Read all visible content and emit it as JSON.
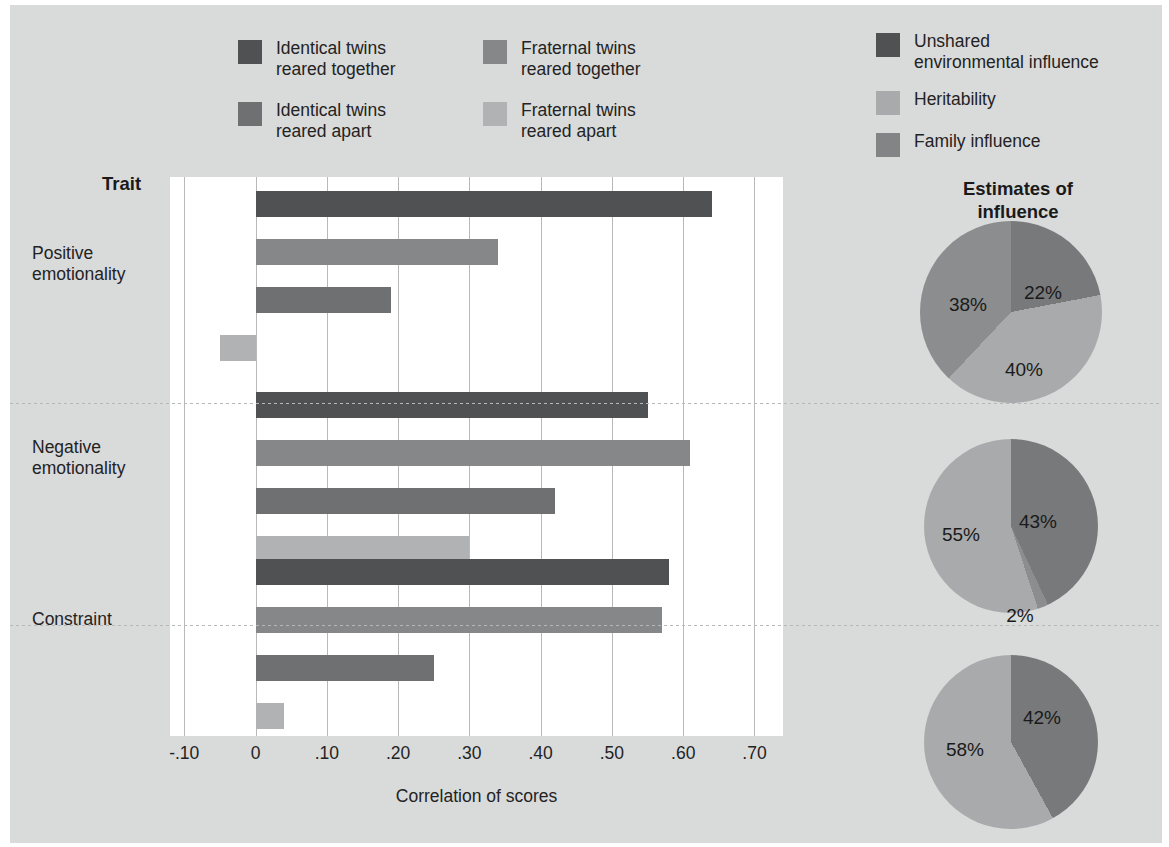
{
  "figure": {
    "background": "#d9dada",
    "plot_background": "#ffffff"
  },
  "bar_legend": {
    "items": [
      {
        "label": "Identical twins\nreared together",
        "color": "#4f5153"
      },
      {
        "label": "Fraternal twins\nreared together",
        "color": "#858789"
      },
      {
        "label": "Identical twins\nreared apart",
        "color": "#6e7072"
      },
      {
        "label": "Fraternal twins\nreared apart",
        "color": "#b0b2b3"
      }
    ]
  },
  "pie_legend": {
    "items": [
      {
        "label": "Unshared\nenvironmental influence",
        "color": "#4f5153"
      },
      {
        "label": "Heritability",
        "color": "#a8aaab"
      },
      {
        "label": "Family influence",
        "color": "#828486"
      }
    ]
  },
  "axis": {
    "trait_header": "Trait",
    "xlabel": "Correlation of scores",
    "xticks": [
      "-.10",
      "0",
      ".10",
      ".20",
      ".30",
      ".40",
      ".50",
      ".60",
      ".70"
    ],
    "xtick_values": [
      -0.1,
      0,
      0.1,
      0.2,
      0.3,
      0.4,
      0.5,
      0.6,
      0.7
    ]
  },
  "pies_title": "Estimates of\ninfluence",
  "chart_data": [
    {
      "type": "bar",
      "title": "",
      "xlabel": "Correlation of scores",
      "ylabel": "Trait",
      "xlim": [
        -0.12,
        0.74
      ],
      "grid": true,
      "orientation": "horizontal",
      "categories": [
        "Positive emotionality",
        "Negative emotionality",
        "Constraint"
      ],
      "series": [
        {
          "name": "Identical twins reared together",
          "color": "#4f5153",
          "values": [
            0.64,
            0.55,
            0.58
          ]
        },
        {
          "name": "Identical twins reared apart",
          "color": "#858789",
          "values": [
            0.34,
            0.61,
            0.57
          ]
        },
        {
          "name": "Fraternal twins reared together",
          "color": "#6e7072",
          "values": [
            0.19,
            0.42,
            0.25
          ]
        },
        {
          "name": "Fraternal twins reared apart",
          "color": "#b0b2b3",
          "values": [
            -0.05,
            0.3,
            0.04
          ]
        }
      ]
    },
    {
      "type": "pie",
      "title": "Estimates of influence",
      "name": "Positive emotionality",
      "labels": [
        "Unshared environmental influence",
        "Heritability",
        "Family influence"
      ],
      "values": [
        22,
        40,
        38
      ],
      "display": [
        "22%",
        "40%",
        "38%"
      ],
      "colors": [
        "#78797b",
        "#a8aaab",
        "#8b8d8e"
      ]
    },
    {
      "type": "pie",
      "name": "Negative emotionality",
      "labels": [
        "Unshared environmental influence",
        "Family influence",
        "Heritability"
      ],
      "values": [
        43,
        2,
        55
      ],
      "display": [
        "43%",
        "2%",
        "55%"
      ],
      "colors": [
        "#78797b",
        "#8b8d8e",
        "#a8aaab"
      ]
    },
    {
      "type": "pie",
      "name": "Constraint",
      "labels": [
        "Unshared environmental influence",
        "Heritability"
      ],
      "values": [
        42,
        58
      ],
      "display": [
        "42%",
        "58%"
      ],
      "colors": [
        "#78797b",
        "#a8aaab"
      ]
    }
  ]
}
